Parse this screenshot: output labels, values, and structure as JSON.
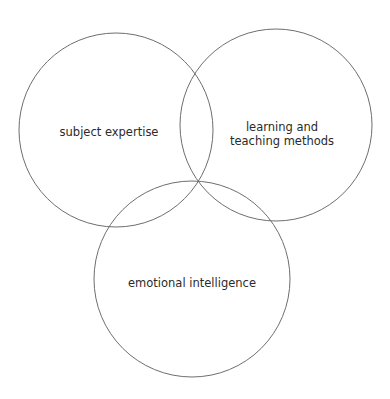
{
  "diagram": {
    "type": "venn",
    "stroke_color": "#6e6e6e",
    "circles": [
      {
        "id": "subject",
        "label": "subject expertise",
        "cx": 116,
        "cy": 130,
        "r": 97
      },
      {
        "id": "methods",
        "label_line1": "learning and",
        "label_line2": "teaching methods",
        "cx": 276,
        "cy": 125,
        "r": 96
      },
      {
        "id": "emotional",
        "label": "emotional intelligence",
        "cx": 192,
        "cy": 279,
        "r": 98
      }
    ]
  }
}
